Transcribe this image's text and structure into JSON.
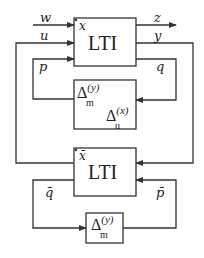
{
  "diagram": {
    "blocks": {
      "top_lti": {
        "title": "LTI",
        "state_label": "x"
      },
      "uncertainty": {
        "delta_m": {
          "symbol": "Δ",
          "sup": "(y)",
          "sub": "m"
        },
        "delta_u": {
          "symbol": "Δ",
          "sup": "(x)",
          "sub": "u"
        }
      },
      "bottom_lti": {
        "title": "LTI",
        "state_label": "x̄"
      },
      "small_delta": {
        "symbol": "Δ",
        "sup": "(y)",
        "sub": "m"
      }
    },
    "signals": {
      "w": "w",
      "u": "u",
      "p": "p",
      "z": "z",
      "y": "y",
      "q": "q",
      "q_bar": "q̄",
      "p_bar": "p̄"
    },
    "colors": {
      "stroke": "#333333",
      "background": "#ffffff"
    }
  }
}
